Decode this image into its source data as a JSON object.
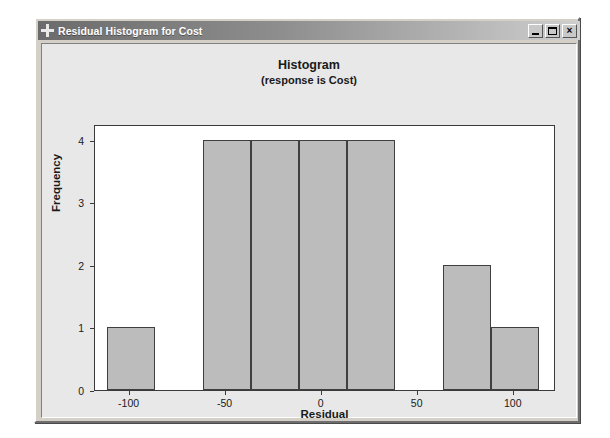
{
  "window": {
    "title": "Residual Histogram for Cost",
    "icon": "plus-crosshair-icon",
    "buttons": {
      "minimize": "_",
      "maximize": "□",
      "close": "×"
    }
  },
  "chart_data": {
    "type": "bar",
    "title": "Histogram",
    "subtitle": "(response is Cost)",
    "xlabel": "Residual",
    "ylabel": "Frequency",
    "xlim": [
      -118,
      122
    ],
    "ylim": [
      0,
      4.25
    ],
    "xticks": [
      -100,
      -50,
      0,
      50,
      100
    ],
    "xtick_labels": [
      "-100",
      "-50",
      "0",
      "50",
      "100"
    ],
    "yticks": [
      0,
      1,
      2,
      3,
      4
    ],
    "ytick_labels": [
      "0",
      "1",
      "2",
      "3",
      "4"
    ],
    "grid": false,
    "legend": false,
    "bin_width": 25,
    "bins": [
      {
        "left": -112,
        "right": -87,
        "center": -100,
        "value": 1
      },
      {
        "left": -87,
        "right": -62,
        "center": -75,
        "value": 0
      },
      {
        "left": -62,
        "right": -37,
        "center": -50,
        "value": 4
      },
      {
        "left": -37,
        "right": -12,
        "center": -25,
        "value": 4
      },
      {
        "left": -12,
        "right": 13,
        "center": 0,
        "value": 4
      },
      {
        "left": 13,
        "right": 38,
        "center": 25,
        "value": 4
      },
      {
        "left": 38,
        "right": 63,
        "center": 50,
        "value": 0
      },
      {
        "left": 63,
        "right": 88,
        "center": 75,
        "value": 2
      },
      {
        "left": 88,
        "right": 113,
        "center": 100,
        "value": 1
      }
    ],
    "categories": [
      "-100",
      "-75",
      "-50",
      "-25",
      "0",
      "25",
      "50",
      "75",
      "100"
    ],
    "values": [
      1,
      0,
      4,
      4,
      4,
      4,
      0,
      2,
      1
    ]
  },
  "colors": {
    "bar_fill": "#bcbcbc",
    "bar_edge": "#3f3f3f",
    "plot_bg": "#ffffff",
    "panel_bg": "#e8e8e8",
    "titlebar_start": "#6b6b6b",
    "titlebar_end": "#cfcfcf",
    "text": "#1a1a1a"
  }
}
